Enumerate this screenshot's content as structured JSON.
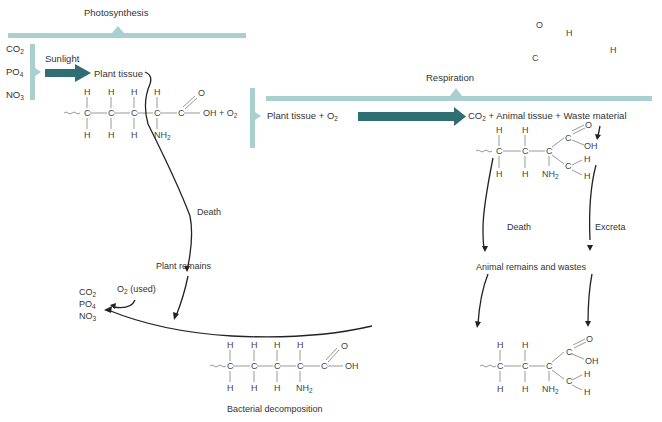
{
  "diagram": {
    "photosynthesis": {
      "title": "Photosynthesis",
      "inputs": [
        "CO2",
        "PO4",
        "NO3"
      ],
      "energy_label": "Sunlight",
      "product": "Plant tissue"
    },
    "plant_molecule": {
      "suffix": "OH + O2"
    },
    "respiration": {
      "title": "Respiration",
      "reactants": "Plant tissue + O2",
      "products": "CO2 + Animal tissue + Waste material"
    },
    "floating_atoms": [
      "O",
      "H",
      "C",
      "H"
    ],
    "plant_path": {
      "death_label": "Death",
      "remains_label": "Plant remains"
    },
    "animal_path": {
      "death_label": "Death",
      "excreta_label": "Excreta",
      "remains_label": "Animal remains and wastes"
    },
    "decomposition": {
      "o2_label": "O2 (used)",
      "outputs": [
        "CO2",
        "PO4",
        "NO3"
      ],
      "caption": "Bacterial decomposition"
    },
    "colors": {
      "bracket": "#a9cfcf",
      "process_arrow": "#2f6f73",
      "curve": "#222222",
      "bond": "#999999"
    }
  }
}
